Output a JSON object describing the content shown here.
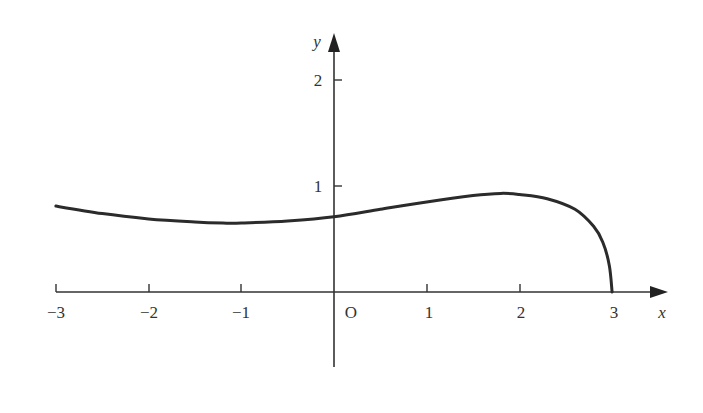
{
  "chart_data": {
    "type": "line",
    "title": "",
    "xlabel": "x",
    "ylabel": "y",
    "origin_label": "O",
    "xlim": [
      -3,
      3.4
    ],
    "ylim": [
      -0.7,
      2.2
    ],
    "grid": false,
    "legend": null,
    "x_ticks": [
      -3,
      -2,
      -1,
      1,
      2,
      3
    ],
    "x_tick_labels": [
      "−3",
      "−2",
      "−1",
      "1",
      "2",
      "3"
    ],
    "y_ticks": [
      1,
      2
    ],
    "y_tick_labels": [
      "1",
      "2"
    ],
    "series": [
      {
        "name": "curve",
        "color": "#2b2b2b",
        "x": [
          -3,
          -2.5,
          -2,
          -1.5,
          -1.2,
          -1,
          -0.5,
          0,
          0.5,
          1,
          1.5,
          1.8,
          2,
          2.3,
          2.6,
          2.8,
          2.9,
          2.97,
          3
        ],
        "y": [
          0.81,
          0.74,
          0.69,
          0.66,
          0.65,
          0.65,
          0.67,
          0.71,
          0.78,
          0.85,
          0.91,
          0.93,
          0.92,
          0.88,
          0.78,
          0.62,
          0.47,
          0.25,
          0
        ]
      }
    ]
  },
  "labels": {
    "x_axis": "x",
    "y_axis": "y",
    "origin": "O",
    "xt0": "−3",
    "xt1": "−2",
    "xt2": "−1",
    "xt3": "1",
    "xt4": "2",
    "xt5": "3",
    "yt0": "1",
    "yt1": "2"
  },
  "colors": {
    "axis": "#333333",
    "curve": "#2b2b2b",
    "background": "#ffffff"
  }
}
